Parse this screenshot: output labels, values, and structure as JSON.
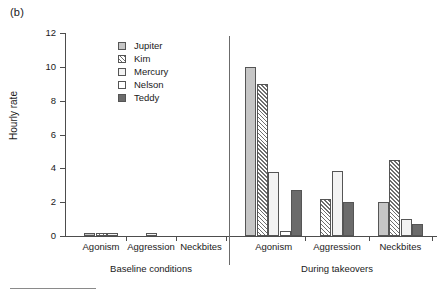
{
  "panel_label": "(b)",
  "axis": {
    "y_title": "Hourly rate",
    "y_ticks": [
      "0",
      "2",
      "4",
      "6",
      "8",
      "10",
      "12"
    ]
  },
  "legend": {
    "items": [
      {
        "label": "Jupiter",
        "swatch": "legend-swatch-jupiter",
        "color": "#c6c6c6"
      },
      {
        "label": "Kim",
        "swatch": "legend-swatch-kim",
        "color": "#6e6e6e"
      },
      {
        "label": "Mercury",
        "swatch": "legend-swatch-mercury",
        "color": "#f3f3f3"
      },
      {
        "label": "Nelson",
        "swatch": "legend-swatch-nelson",
        "color": "#ffffff"
      },
      {
        "label": "Teddy",
        "swatch": "legend-swatch-teddy",
        "color": "#6b6b6b"
      }
    ]
  },
  "panels": [
    {
      "caption": "Baseline conditions",
      "groups": [
        "Agonism",
        "Aggression",
        "Neckbites"
      ]
    },
    {
      "caption": "During takeovers",
      "groups": [
        "Agonism",
        "Aggression",
        "Neckbites"
      ]
    }
  ],
  "chart_data": {
    "type": "bar",
    "title": "(b)",
    "xlabel": "",
    "ylabel": "Hourly rate",
    "ylim": [
      0,
      12
    ],
    "ytick_step": 2,
    "grid": false,
    "legend_position": "upper-left-inside",
    "panels": [
      "Baseline conditions",
      "During takeovers"
    ],
    "categories": [
      "Agonism",
      "Aggression",
      "Neckbites"
    ],
    "series": [
      {
        "name": "Jupiter",
        "fill": "solid-light-gray",
        "color": "#c6c6c6",
        "values": {
          "Baseline conditions": {
            "Agonism": 0.2,
            "Aggression": 0.0,
            "Neckbites": 0.0
          },
          "During takeovers": {
            "Agonism": 10.0,
            "Aggression": 0.0,
            "Neckbites": 2.0
          }
        }
      },
      {
        "name": "Kim",
        "fill": "diagonal-hatch",
        "color": "#6e6e6e",
        "values": {
          "Baseline conditions": {
            "Agonism": 0.2,
            "Aggression": 0.0,
            "Neckbites": 0.0
          },
          "During takeovers": {
            "Agonism": 9.0,
            "Aggression": 2.2,
            "Neckbites": 4.5
          }
        }
      },
      {
        "name": "Mercury",
        "fill": "solid-very-light",
        "color": "#f3f3f3",
        "values": {
          "Baseline conditions": {
            "Agonism": 0.2,
            "Aggression": 0.2,
            "Neckbites": 0.0
          },
          "During takeovers": {
            "Agonism": 3.8,
            "Aggression": 3.85,
            "Neckbites": 1.0
          }
        }
      },
      {
        "name": "Nelson",
        "fill": "white",
        "color": "#ffffff",
        "values": {
          "Baseline conditions": {
            "Agonism": 0.0,
            "Aggression": 0.0,
            "Neckbites": 0.0
          },
          "During takeovers": {
            "Agonism": 0.3,
            "Aggression": 0.0,
            "Neckbites": 0.0
          }
        }
      },
      {
        "name": "Teddy",
        "fill": "solid-dark-gray",
        "color": "#6b6b6b",
        "values": {
          "Baseline conditions": {
            "Agonism": 0.0,
            "Aggression": 0.0,
            "Neckbites": 0.0
          },
          "During takeovers": {
            "Agonism": 2.7,
            "Aggression": 2.0,
            "Neckbites": 0.7
          }
        }
      }
    ]
  }
}
